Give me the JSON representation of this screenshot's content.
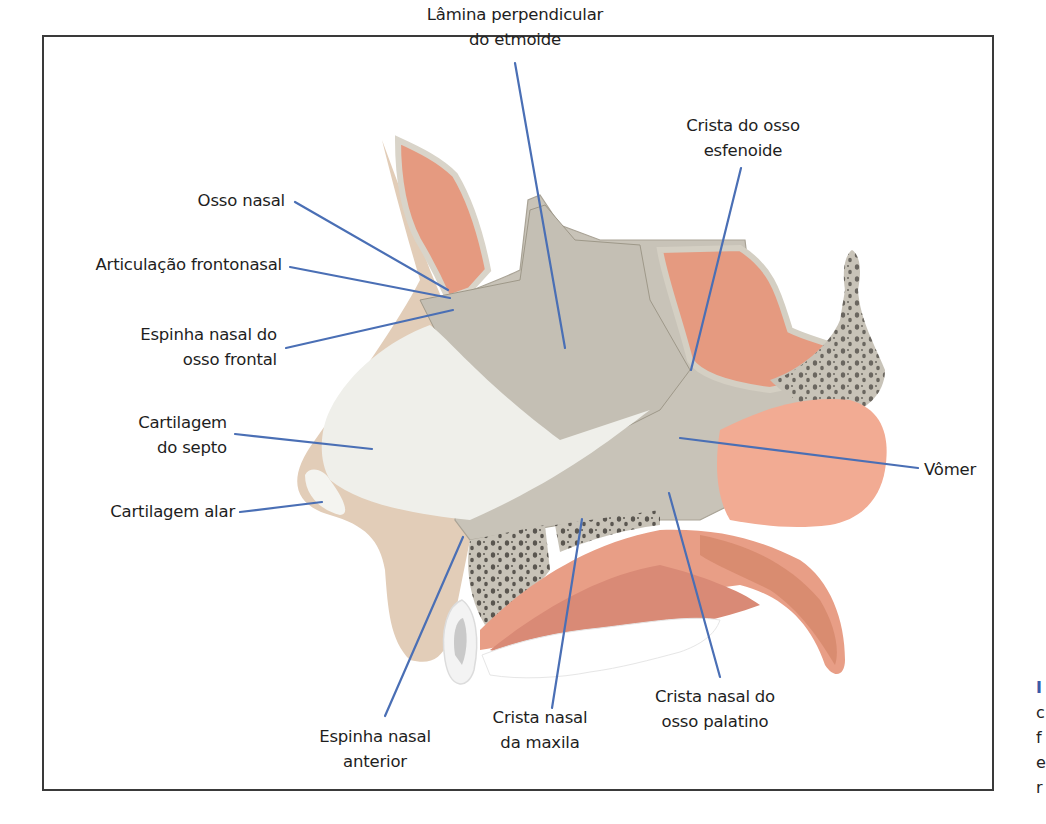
{
  "figure": {
    "colors": {
      "leader_line": "#4a6fb5",
      "bone": "#c8c3b8",
      "bone_border": "#d9d4c9",
      "cartilage": "#efefea",
      "soft_tissue": "#e2cdb8",
      "mucosa": "#e59a80",
      "mucosa_light": "#f2b4a0",
      "cancellous_dots": "#5a5650",
      "frame": "#3a3a3a"
    },
    "labels": {
      "lamina_perpendicular": {
        "line1": "Lâmina perpendicular",
        "line2": "do etmoide"
      },
      "crista_esfenoide": {
        "line1": "Crista do osso",
        "line2": "esfenoide"
      },
      "osso_nasal": {
        "line1": "Osso nasal"
      },
      "articulacao_frontonasal": {
        "line1": "Articulação frontonasal"
      },
      "espinha_nasal_frontal": {
        "line1": "Espinha nasal do",
        "line2": "osso frontal"
      },
      "cartilagem_septo": {
        "line1": "Cartilagem",
        "line2": "do septo"
      },
      "cartilagem_alar": {
        "line1": "Cartilagem alar"
      },
      "vomer": {
        "line1": "Vômer"
      },
      "espinha_nasal_anterior": {
        "line1": "Espinha nasal",
        "line2": "anterior"
      },
      "crista_nasal_maxila": {
        "line1": "Crista nasal",
        "line2": "da maxila"
      },
      "crista_nasal_palatino": {
        "line1": "Crista nasal do",
        "line2": "osso palatino"
      }
    },
    "side_caption_clipped": [
      "I",
      "c",
      "f",
      "e",
      "r"
    ]
  }
}
